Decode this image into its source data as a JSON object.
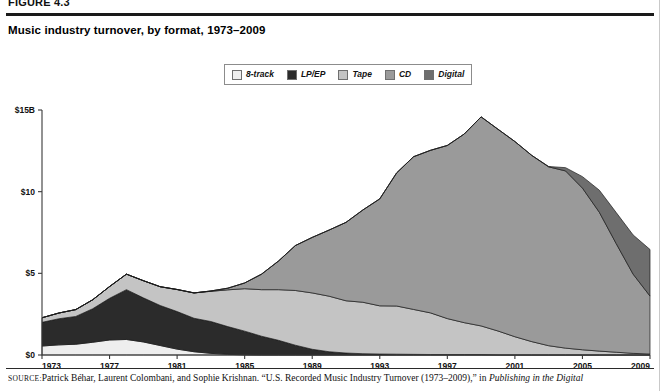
{
  "figure": {
    "number": "FIGURE 4.3",
    "title": "Music industry turnover, by format, 1973–2009"
  },
  "legend": {
    "position": "top-center",
    "items": [
      {
        "label": "8-track",
        "color": "#eeeeee"
      },
      {
        "label": "LP/EP",
        "color": "#2b2b2b"
      },
      {
        "label": "Tape",
        "color": "#c4c4c4"
      },
      {
        "label": "CD",
        "color": "#9a9a9a"
      },
      {
        "label": "Digital",
        "color": "#6e6e6e"
      }
    ]
  },
  "source": {
    "prefix": "SOURCE:",
    "text": "Patrick Béhar, Laurent Colombani, and Sophie Krishnan. “U.S. Recorded Music Industry Turnover (1973–2009),” in ",
    "italic_tail": "Publishing in the Digital"
  },
  "chart_data": {
    "type": "area",
    "stacked": true,
    "title": "Music industry turnover, by format, 1973–2009",
    "xlabel": "",
    "ylabel": "",
    "grid": false,
    "legend_position": "top-center",
    "xlim": [
      1973,
      2009
    ],
    "ylim": [
      0,
      15
    ],
    "yticks": [
      0,
      5,
      10,
      15
    ],
    "ytick_labels": [
      "$0",
      "$5",
      "$10",
      "$15B"
    ],
    "xticks": [
      1973,
      1977,
      1981,
      1985,
      1989,
      1993,
      1997,
      2001,
      2005,
      2009
    ],
    "xtick_labels": [
      "1973",
      "1977",
      "1981",
      "1985",
      "1989",
      "1993",
      "1997",
      "2001",
      "2005",
      "2009"
    ],
    "units": "billions of US dollars",
    "x": [
      1973,
      1974,
      1975,
      1976,
      1977,
      1978,
      1979,
      1980,
      1981,
      1982,
      1983,
      1984,
      1985,
      1986,
      1987,
      1988,
      1989,
      1990,
      1991,
      1992,
      1993,
      1994,
      1995,
      1996,
      1997,
      1998,
      1999,
      2000,
      2001,
      2002,
      2003,
      2004,
      2005,
      2006,
      2007,
      2008,
      2009
    ],
    "series": [
      {
        "name": "8-track",
        "color": "#eeeeee",
        "values": [
          0.55,
          0.62,
          0.66,
          0.78,
          0.92,
          0.95,
          0.8,
          0.58,
          0.36,
          0.2,
          0.1,
          0.04,
          0.01,
          0.0,
          0.0,
          0.0,
          0.0,
          0.0,
          0.0,
          0.0,
          0.0,
          0.0,
          0.0,
          0.0,
          0.0,
          0.0,
          0.0,
          0.0,
          0.0,
          0.0,
          0.0,
          0.0,
          0.0,
          0.0,
          0.0,
          0.0,
          0.0
        ]
      },
      {
        "name": "LP/EP",
        "color": "#2b2b2b",
        "values": [
          1.45,
          1.6,
          1.7,
          2.05,
          2.55,
          3.05,
          2.7,
          2.45,
          2.3,
          2.05,
          1.95,
          1.7,
          1.45,
          1.15,
          0.9,
          0.6,
          0.35,
          0.2,
          0.12,
          0.08,
          0.06,
          0.05,
          0.04,
          0.03,
          0.03,
          0.03,
          0.03,
          0.02,
          0.02,
          0.02,
          0.02,
          0.02,
          0.02,
          0.02,
          0.02,
          0.02,
          0.02
        ]
      },
      {
        "name": "Tape",
        "color": "#c4c4c4",
        "values": [
          0.28,
          0.35,
          0.42,
          0.55,
          0.72,
          0.95,
          1.05,
          1.15,
          1.35,
          1.55,
          1.85,
          2.25,
          2.6,
          2.85,
          3.1,
          3.35,
          3.45,
          3.4,
          3.2,
          3.15,
          2.95,
          2.95,
          2.75,
          2.55,
          2.2,
          1.95,
          1.75,
          1.45,
          1.1,
          0.8,
          0.55,
          0.4,
          0.3,
          0.22,
          0.15,
          0.08,
          0.04
        ]
      },
      {
        "name": "CD",
        "color": "#9a9a9a",
        "values": [
          0,
          0,
          0,
          0,
          0,
          0,
          0,
          0,
          0,
          0,
          0.02,
          0.1,
          0.35,
          0.95,
          1.75,
          2.75,
          3.4,
          4.05,
          4.8,
          5.65,
          6.55,
          8.15,
          9.35,
          9.95,
          10.6,
          11.55,
          12.8,
          12.35,
          11.95,
          11.4,
          10.95,
          10.85,
          9.9,
          8.5,
          6.65,
          4.85,
          3.55
        ]
      },
      {
        "name": "Digital",
        "color": "#6e6e6e",
        "values": [
          0,
          0,
          0,
          0,
          0,
          0,
          0,
          0,
          0,
          0,
          0,
          0,
          0,
          0,
          0,
          0,
          0,
          0,
          0,
          0,
          0,
          0,
          0,
          0,
          0,
          0,
          0,
          0,
          0,
          0,
          0.02,
          0.2,
          0.7,
          1.35,
          1.9,
          2.4,
          2.85
        ]
      }
    ],
    "totals": [
      2.28,
      2.57,
      2.78,
      3.38,
      4.19,
      4.95,
      4.55,
      4.18,
      4.01,
      3.8,
      3.92,
      4.09,
      4.41,
      4.95,
      5.75,
      6.7,
      7.2,
      7.65,
      8.12,
      8.88,
      9.56,
      11.15,
      12.14,
      12.53,
      12.83,
      13.53,
      14.58,
      13.82,
      13.07,
      12.22,
      11.54,
      11.47,
      10.92,
      10.09,
      8.72,
      7.35,
      6.46
    ]
  }
}
